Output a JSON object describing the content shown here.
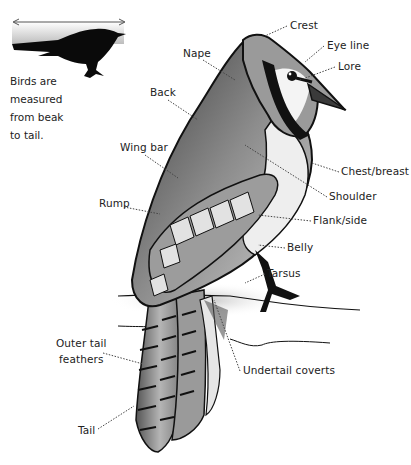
{
  "inset": {
    "caption_lines": [
      "Birds are",
      "measured",
      "from beak",
      "to tail."
    ],
    "measure_arrow": "double-headed-arrow"
  },
  "labels": {
    "crest": "Crest",
    "eye_line": "Eye line",
    "lore": "Lore",
    "nape": "Nape",
    "back": "Back",
    "wing_bar": "Wing bar",
    "rump": "Rump",
    "chest_breast": "Chest/breast",
    "shoulder": "Shoulder",
    "flank_side": "Flank/side",
    "belly": "Belly",
    "tarsus": "Tarsus",
    "undertail_coverts": "Undertail coverts",
    "outer_tail_feathers": [
      "Outer tail",
      "feathers"
    ],
    "tail": "Tail"
  },
  "colors": {
    "ink": "#111111",
    "leader": "#444444",
    "body_gray": "#8a8a8a",
    "light_gray": "#d6d6d6"
  }
}
